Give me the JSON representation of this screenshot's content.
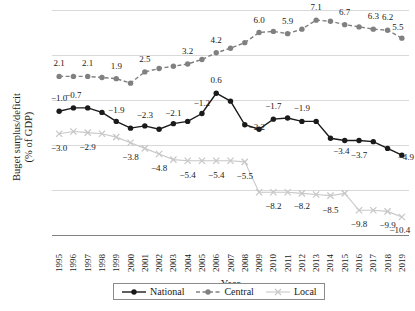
{
  "chart_data": {
    "type": "line",
    "title": "",
    "xlabel": "Year",
    "ylabel": "Buget surplus/deficit (% of GDP)",
    "ylabel_line1": "Buget surplus/deficit",
    "ylabel_line2": "(% of GDP)",
    "ylim": [
      -12,
      8
    ],
    "yticks": [
      8,
      4,
      0,
      -4,
      -8,
      -12
    ],
    "ytick_labels": [
      "8",
      "4",
      "0",
      "−4",
      "−8",
      "−12"
    ],
    "grid": true,
    "legend_position": "bottom",
    "categories": [
      "1995",
      "1996",
      "1997",
      "1998",
      "1999",
      "2000",
      "2001",
      "2002",
      "2003",
      "2004",
      "2005",
      "2006",
      "2007",
      "2008",
      "2009",
      "2010",
      "2011",
      "2012",
      "2013",
      "2014",
      "2015",
      "2016",
      "2017",
      "2018",
      "2019"
    ],
    "series": [
      {
        "name": "National",
        "color": "#1a1a1a",
        "marker": "circle",
        "dash": "solid",
        "values": [
          -1.0,
          -0.7,
          -0.7,
          -1.1,
          -1.9,
          -2.5,
          -2.3,
          -2.6,
          -2.1,
          -1.9,
          -1.2,
          0.6,
          -0.1,
          -2.2,
          -2.6,
          -1.7,
          -1.6,
          -1.9,
          -1.9,
          -3.4,
          -3.6,
          -3.6,
          -3.7,
          -4.3,
          -4.9
        ],
        "labels": [
          {
            "year": "1995",
            "value": -1.0,
            "text": "−1.0"
          },
          {
            "year": "1996",
            "value": -0.7,
            "text": "−0.7"
          },
          {
            "year": "1999",
            "value": -1.9,
            "text": "−1.9"
          },
          {
            "year": "2001",
            "value": -2.3,
            "text": "−2.3"
          },
          {
            "year": "2003",
            "value": -2.1,
            "text": "−2.1"
          },
          {
            "year": "2005",
            "value": -1.2,
            "text": "−1.2"
          },
          {
            "year": "2006",
            "value": 0.6,
            "text": "0.6"
          },
          {
            "year": "2008",
            "value": -2.2,
            "text": "−2.2"
          },
          {
            "year": "2010",
            "value": -1.7,
            "text": "−1.7"
          },
          {
            "year": "2012",
            "value": -1.9,
            "text": "−1.9"
          },
          {
            "year": "2014",
            "value": -3.4,
            "text": "−3.4"
          },
          {
            "year": "2016",
            "value": -3.7,
            "text": "−3.7"
          },
          {
            "year": "2019",
            "value": -4.9,
            "text": "−4.9"
          }
        ]
      },
      {
        "name": "Central",
        "color": "#808080",
        "marker": "circle",
        "dash": "dashed",
        "values": [
          2.1,
          2.1,
          2.1,
          2.0,
          1.9,
          1.5,
          2.5,
          2.8,
          3.0,
          3.2,
          3.6,
          4.2,
          4.6,
          5.1,
          6.0,
          6.1,
          5.9,
          6.3,
          7.1,
          7.0,
          6.7,
          6.5,
          6.3,
          6.2,
          5.5
        ],
        "labels": [
          {
            "year": "1995",
            "value": 2.1,
            "text": "2.1"
          },
          {
            "year": "1997",
            "value": 2.1,
            "text": "2.1"
          },
          {
            "year": "1999",
            "value": 1.9,
            "text": "1.9"
          },
          {
            "year": "2001",
            "value": 2.5,
            "text": "2.5"
          },
          {
            "year": "2004",
            "value": 3.2,
            "text": "3.2"
          },
          {
            "year": "2006",
            "value": 4.2,
            "text": "4.2"
          },
          {
            "year": "2009",
            "value": 6.0,
            "text": "6.0"
          },
          {
            "year": "2011",
            "value": 5.9,
            "text": "5.9"
          },
          {
            "year": "2013",
            "value": 7.1,
            "text": "7.1"
          },
          {
            "year": "2015",
            "value": 6.7,
            "text": "6.7"
          },
          {
            "year": "2017",
            "value": 6.3,
            "text": "6.3"
          },
          {
            "year": "2018",
            "value": 6.2,
            "text": "6.2"
          },
          {
            "year": "2019",
            "value": 5.5,
            "text": "5.5"
          }
        ]
      },
      {
        "name": "Local",
        "color": "#c8c8c8",
        "marker": "x",
        "dash": "solid",
        "values": [
          -3.0,
          -2.8,
          -2.9,
          -3.0,
          -3.3,
          -3.8,
          -4.3,
          -4.8,
          -5.3,
          -5.4,
          -5.4,
          -5.4,
          -5.4,
          -5.5,
          -8.2,
          -8.2,
          -8.2,
          -8.3,
          -8.4,
          -8.5,
          -8.3,
          -9.8,
          -9.8,
          -9.9,
          -10.4
        ],
        "labels": [
          {
            "year": "1995",
            "value": -3.0,
            "text": "−3.0"
          },
          {
            "year": "1997",
            "value": -2.9,
            "text": "−2.9"
          },
          {
            "year": "2000",
            "value": -3.8,
            "text": "−3.8"
          },
          {
            "year": "2002",
            "value": -4.8,
            "text": "−4.8"
          },
          {
            "year": "2004",
            "value": -5.4,
            "text": "−5.4"
          },
          {
            "year": "2006",
            "value": -5.4,
            "text": "−5.4"
          },
          {
            "year": "2008",
            "value": -5.5,
            "text": "−5.5"
          },
          {
            "year": "2010",
            "value": -8.2,
            "text": "−8.2"
          },
          {
            "year": "2012",
            "value": -8.2,
            "text": "−8.2"
          },
          {
            "year": "2014",
            "value": -8.5,
            "text": "−8.5"
          },
          {
            "year": "2016",
            "value": -9.8,
            "text": "−9.8"
          },
          {
            "year": "2018",
            "value": -9.9,
            "text": "−9.9"
          },
          {
            "year": "2019",
            "value": -10.4,
            "text": "−10.4"
          }
        ]
      }
    ],
    "legend": [
      {
        "label": "National",
        "color": "#1a1a1a",
        "marker": "circle",
        "dash": "solid"
      },
      {
        "label": "Central",
        "color": "#808080",
        "marker": "circle",
        "dash": "dashed"
      },
      {
        "label": "Local",
        "color": "#c8c8c8",
        "marker": "x",
        "dash": "solid"
      }
    ]
  }
}
